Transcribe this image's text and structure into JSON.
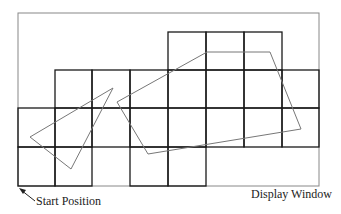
{
  "labels": {
    "start_position": "Start Position",
    "display_window": "Display Window"
  },
  "display_window": {
    "x": 18,
    "y": 13,
    "width": 301,
    "height": 173
  },
  "grid": {
    "columns": [
      18,
      55,
      92,
      130,
      168,
      206,
      244,
      282,
      319
    ],
    "rows": [
      32,
      70,
      108,
      147,
      186
    ],
    "cells": [
      {
        "row": 0,
        "col": 4
      },
      {
        "row": 0,
        "col": 5
      },
      {
        "row": 0,
        "col": 6
      },
      {
        "row": 1,
        "col": 1
      },
      {
        "row": 1,
        "col": 2
      },
      {
        "row": 1,
        "col": 3
      },
      {
        "row": 1,
        "col": 4
      },
      {
        "row": 1,
        "col": 5
      },
      {
        "row": 1,
        "col": 6
      },
      {
        "row": 1,
        "col": 7
      },
      {
        "row": 2,
        "col": 0
      },
      {
        "row": 2,
        "col": 1
      },
      {
        "row": 2,
        "col": 2
      },
      {
        "row": 2,
        "col": 3
      },
      {
        "row": 2,
        "col": 4
      },
      {
        "row": 2,
        "col": 5
      },
      {
        "row": 2,
        "col": 6
      },
      {
        "row": 2,
        "col": 7
      },
      {
        "row": 3,
        "col": 0
      },
      {
        "row": 3,
        "col": 1
      },
      {
        "row": 3,
        "col": 3
      },
      {
        "row": 3,
        "col": 4
      }
    ]
  },
  "shapes": {
    "triangle": [
      [
        30,
        137
      ],
      [
        113,
        88
      ],
      [
        71,
        169
      ]
    ],
    "polygon": [
      [
        117,
        102
      ],
      [
        207,
        52
      ],
      [
        270,
        52
      ],
      [
        301,
        129
      ],
      [
        148,
        154
      ]
    ]
  },
  "colors": {
    "grid": "#1a1a1a",
    "window": "#888888",
    "shape": "#777777"
  }
}
